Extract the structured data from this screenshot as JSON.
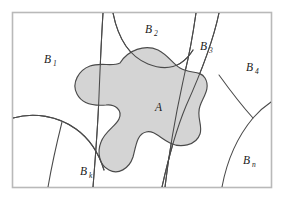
{
  "figure": {
    "frame": {
      "border_color": "#b9b9b9",
      "background_color": "#ffffff"
    },
    "set_a": {
      "label": "A",
      "fill_color": "#d4d4d4",
      "stroke_color": "#4a4a4a"
    },
    "partition": {
      "stroke_color": "#4a4a4a"
    },
    "regions": [
      {
        "id": "b1",
        "base": "B",
        "subscript": "1",
        "label": "B1"
      },
      {
        "id": "b2",
        "base": "B",
        "subscript": "2",
        "label": "B2"
      },
      {
        "id": "b3",
        "base": "B",
        "subscript": "3",
        "label": "B3"
      },
      {
        "id": "b4",
        "base": "B",
        "subscript": "4",
        "label": "B4"
      },
      {
        "id": "bk",
        "base": "B",
        "subscript": "k",
        "label": "Bk"
      },
      {
        "id": "bn",
        "base": "B",
        "subscript": "n",
        "label": "Bn"
      }
    ]
  }
}
